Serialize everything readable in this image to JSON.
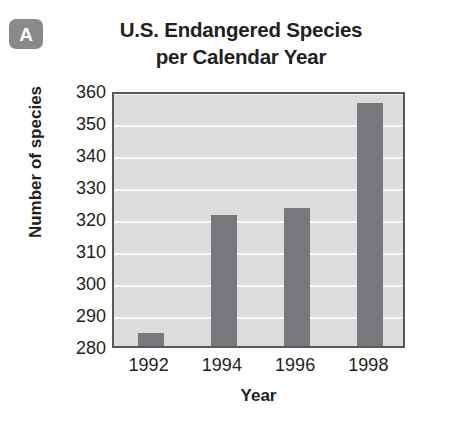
{
  "panel": {
    "badge_letter": "A",
    "badge_color": "#8a8a8a"
  },
  "title": {
    "line1": "U.S. Endangered Species",
    "line2": "per Calendar Year",
    "full": "U.S. Endangered Species per Calendar Year"
  },
  "colors": {
    "bar": "#77787b",
    "plot_background": "#dcdcdc",
    "gridline": "#f7f7f7",
    "frame": "#58595b",
    "text": "#231f20"
  },
  "chart_data": {
    "type": "bar",
    "title": "U.S. Endangered Species per Calendar Year",
    "categories": [
      "1992",
      "1994",
      "1996",
      "1998"
    ],
    "values": [
      284,
      321,
      323,
      356
    ],
    "series": [
      {
        "name": "Number of species",
        "values": [
          284,
          321,
          323,
          356
        ]
      }
    ],
    "xlabel": "Year",
    "ylabel": "Number of species",
    "ylim": [
      280,
      360
    ],
    "yticks": [
      360,
      350,
      340,
      330,
      320,
      310,
      300,
      290,
      280
    ],
    "ytick_labels": [
      "360",
      "350",
      "340",
      "330",
      "320",
      "310",
      "300",
      "290",
      "280"
    ],
    "xtick_labels": [
      "1992",
      "1994",
      "1996",
      "1998"
    ],
    "grid": true,
    "grid_axis": "y",
    "legend": false,
    "legend_position": "none"
  }
}
